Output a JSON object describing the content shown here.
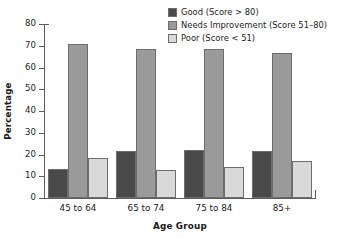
{
  "chart_data": {
    "type": "bar",
    "title": "",
    "xlabel": "Age Group",
    "ylabel": "Percentage",
    "categories": [
      "45 to 64",
      "65 to 74",
      "75 to 84",
      "85+"
    ],
    "series": [
      {
        "name": "Good (Score > 80)",
        "color": "#4a4a4a",
        "values": [
          13.3,
          21.6,
          22.2,
          21.4
        ]
      },
      {
        "name": "Needs Improvement (Score 51–80)",
        "color": "#9a9a9a",
        "values": [
          70.8,
          68.3,
          68.3,
          66.9
        ]
      },
      {
        "name": "Poor (Score < 51)",
        "color": "#d9d9d9",
        "values": [
          18.5,
          13.0,
          14.4,
          16.8
        ]
      }
    ],
    "ylim": [
      0,
      80
    ],
    "yticks": [
      0,
      10,
      20,
      30,
      40,
      50,
      60,
      70,
      80
    ],
    "ytick_labels": [
      "0",
      "10",
      "20",
      "30",
      "40",
      "50",
      "60",
      "70",
      "80"
    ],
    "grid": false,
    "legend_position": "top-right"
  },
  "legend": {
    "items": [
      {
        "label": "Good (Score > 80)",
        "color": "#4a4a4a"
      },
      {
        "label": "Needs Improvement (Score 51–80)",
        "color": "#9a9a9a"
      },
      {
        "label": "Poor (Score < 51)",
        "color": "#d9d9d9"
      }
    ]
  },
  "axes": {
    "y_title": "Percentage",
    "x_title": "Age Group"
  }
}
